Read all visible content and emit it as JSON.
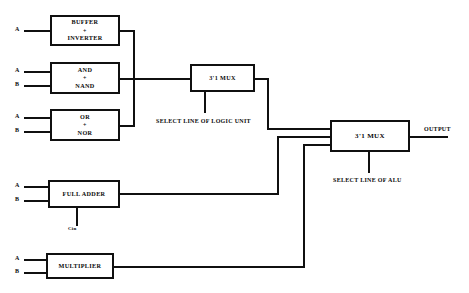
{
  "diagram": {
    "line_color": "#101010",
    "background": "#ffffff"
  },
  "blocks": {
    "buffer_inverter": {
      "line1": "BUFFER",
      "plus": "+",
      "line2": "INVERTER"
    },
    "and_nand": {
      "line1": "AND",
      "plus": "+",
      "line2": "NAND"
    },
    "or_nor": {
      "line1": "OR",
      "plus": "+",
      "line2": "NOR"
    },
    "full_adder": {
      "line1": "FULL ADDER"
    },
    "multiplier": {
      "line1": "MULTIPLIER"
    },
    "logic_mux": {
      "line1": "3'1 MUX"
    },
    "alu_mux": {
      "line1": "3'1 MUX"
    }
  },
  "ports": {
    "buffer_a": "A",
    "and_a": "A",
    "and_b": "B",
    "or_a": "A",
    "or_b": "B",
    "adder_a": "A",
    "adder_b": "B",
    "adder_cin": "Cin",
    "mult_a": "A",
    "mult_b": "B",
    "output": "OUTPUT"
  },
  "captions": {
    "logic_select": "SELECT LINE OF LOGIC UNIT",
    "alu_select": "SELECT LINE OF ALU"
  }
}
